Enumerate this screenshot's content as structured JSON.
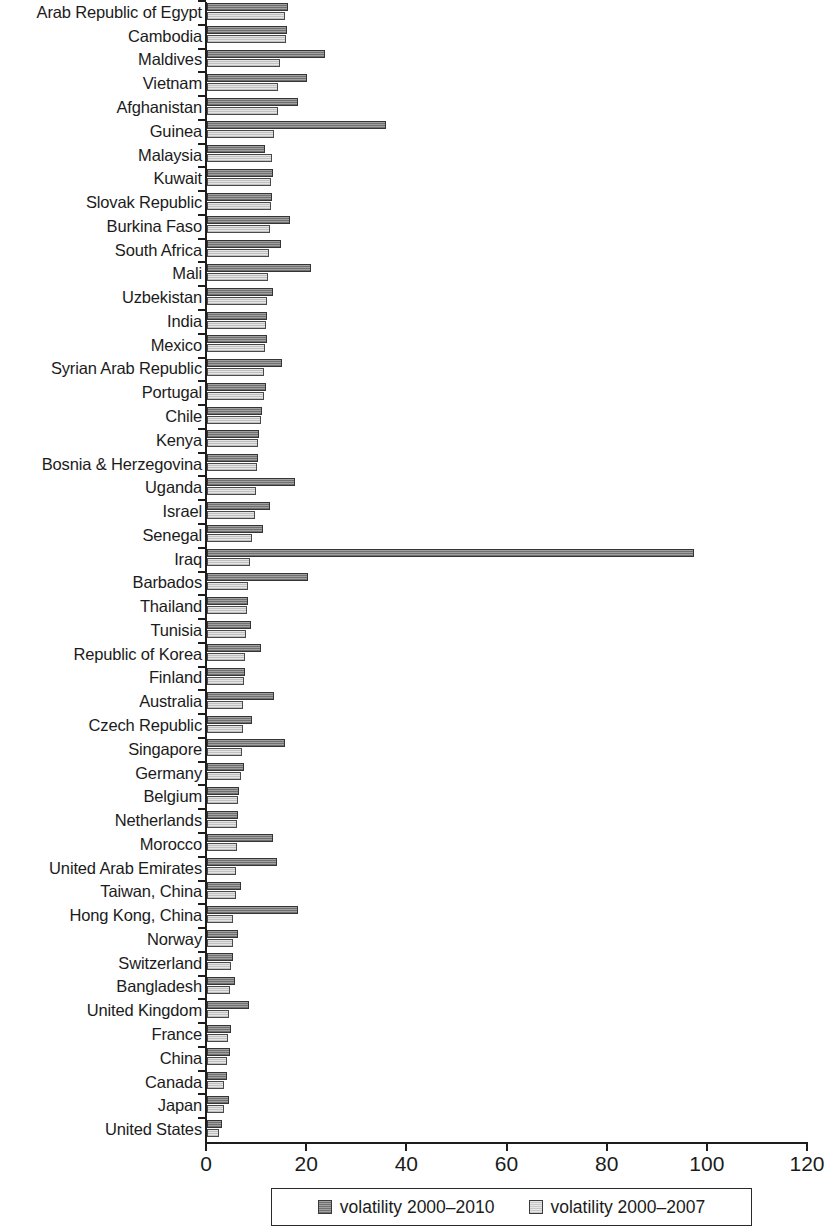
{
  "chart_data": {
    "type": "bar",
    "orientation": "horizontal",
    "title": "",
    "subtitle": "",
    "xlabel": "",
    "ylabel": "",
    "xlim": [
      0,
      120
    ],
    "xticks": [
      0,
      20,
      40,
      60,
      80,
      100,
      120
    ],
    "grid": false,
    "legend_position": "bottom",
    "categories": [
      "Arab Republic of Egypt",
      "Cambodia",
      "Maldives",
      "Vietnam",
      "Afghanistan",
      "Guinea",
      "Malaysia",
      "Kuwait",
      "Slovak Republic",
      "Burkina Faso",
      "South Africa",
      "Mali",
      "Uzbekistan",
      "India",
      "Mexico",
      "Syrian Arab Republic",
      "Portugal",
      "Chile",
      "Kenya",
      "Bosnia & Herzegovina",
      "Uganda",
      "Israel",
      "Senegal",
      "Iraq",
      "Barbados",
      "Thailand",
      "Tunisia",
      "Republic of Korea",
      "Finland",
      "Australia",
      "Czech Republic",
      "Singapore",
      "Germany",
      "Belgium",
      "Netherlands",
      "Morocco",
      "United Arab Emirates",
      "Taiwan, China",
      "Hong Kong, China",
      "Norway",
      "Switzerland",
      "Bangladesh",
      "United Kingdom",
      "France",
      "China",
      "Canada",
      "Japan",
      "United States"
    ],
    "series": [
      {
        "name": "volatility 2000-2010",
        "color": "#7d7d7d",
        "values": [
          16.2,
          16.0,
          23.6,
          19.9,
          18.2,
          35.7,
          11.6,
          13.2,
          12.9,
          16.6,
          14.8,
          20.7,
          13.2,
          11.9,
          12.0,
          14.9,
          11.8,
          11.0,
          10.4,
          10.1,
          17.6,
          12.6,
          11.1,
          97.2,
          20.2,
          8.2,
          8.8,
          10.7,
          7.6,
          13.3,
          8.9,
          15.5,
          7.4,
          6.3,
          6.2,
          13.2,
          14.0,
          6.8,
          18.2,
          6.2,
          5.2,
          5.6,
          8.3,
          4.8,
          4.6,
          4.0,
          4.4,
          2.9
        ]
      },
      {
        "name": "volatility 2000-2007",
        "color": "#cfcfcf",
        "values": [
          15.6,
          15.8,
          14.6,
          14.2,
          14.1,
          13.4,
          13.0,
          12.8,
          12.8,
          12.6,
          12.4,
          12.1,
          11.9,
          11.8,
          11.6,
          11.4,
          11.3,
          10.8,
          10.2,
          9.9,
          9.8,
          9.6,
          9.0,
          8.6,
          8.2,
          7.9,
          7.8,
          7.5,
          7.4,
          7.2,
          7.1,
          6.9,
          6.8,
          6.2,
          6.0,
          5.9,
          5.8,
          5.7,
          5.2,
          5.1,
          4.8,
          4.6,
          4.4,
          4.1,
          3.9,
          3.4,
          3.3,
          2.3
        ]
      }
    ],
    "legend": [
      {
        "label": "volatility 2000–2010",
        "swatch": "dark"
      },
      {
        "label": "volatility 2000–2007",
        "swatch": "light"
      }
    ]
  }
}
